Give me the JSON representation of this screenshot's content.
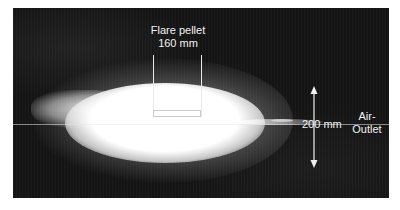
{
  "figure": {
    "pellet_label": {
      "line1": "Flare pellet",
      "line2": "160 mm"
    },
    "dimension_label": "200 mm",
    "outlet_label": {
      "line1": "Air-",
      "line2": "Outlet"
    },
    "colors": {
      "background": "#141414",
      "annotation": "#f2f2f2",
      "flare": "#ffffff"
    }
  }
}
